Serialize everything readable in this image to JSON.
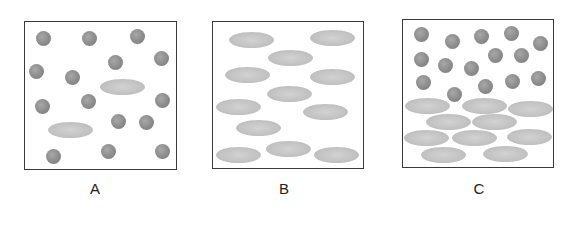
{
  "colors": {
    "border": "#3a3a3a",
    "sphere": "#8e8e8e",
    "ellipse": "#c2c2c2",
    "background": "#ffffff"
  },
  "panels": [
    {
      "label": "A",
      "box": {
        "left": 24,
        "top": 21,
        "right": 177,
        "bottom": 170
      },
      "label_pos": [
        95,
        188
      ],
      "spheres": [
        [
          43,
          38
        ],
        [
          89,
          38
        ],
        [
          137,
          36
        ],
        [
          115,
          62
        ],
        [
          161,
          58
        ],
        [
          36,
          71
        ],
        [
          72,
          77
        ],
        [
          42,
          106
        ],
        [
          88,
          101
        ],
        [
          162,
          100
        ],
        [
          118,
          121
        ],
        [
          146,
          122
        ],
        [
          53,
          156
        ],
        [
          108,
          151
        ],
        [
          162,
          151
        ]
      ],
      "ellipses": [
        [
          122,
          87
        ],
        [
          70,
          130
        ]
      ]
    },
    {
      "label": "B",
      "box": {
        "left": 212,
        "top": 21,
        "right": 364,
        "bottom": 169
      },
      "label_pos": [
        284,
        188
      ],
      "spheres": [],
      "ellipses": [
        [
          251,
          40
        ],
        [
          332,
          38
        ],
        [
          290,
          58
        ],
        [
          247,
          75
        ],
        [
          332,
          77
        ],
        [
          289,
          94
        ],
        [
          238,
          107
        ],
        [
          325,
          112
        ],
        [
          258,
          128
        ],
        [
          238,
          155
        ],
        [
          288,
          149
        ],
        [
          336,
          155
        ]
      ]
    },
    {
      "label": "C",
      "box": {
        "left": 402,
        "top": 19,
        "right": 554,
        "bottom": 168
      },
      "label_pos": [
        479,
        188
      ],
      "spheres": [
        [
          421,
          34
        ],
        [
          452,
          41
        ],
        [
          481,
          36
        ],
        [
          511,
          33
        ],
        [
          540,
          43
        ],
        [
          421,
          59
        ],
        [
          445,
          65
        ],
        [
          471,
          68
        ],
        [
          495,
          55
        ],
        [
          521,
          55
        ],
        [
          423,
          82
        ],
        [
          485,
          86
        ],
        [
          512,
          81
        ],
        [
          538,
          78
        ],
        [
          454,
          94
        ]
      ],
      "ellipses": [
        [
          427,
          106
        ],
        [
          484,
          106
        ],
        [
          530,
          109
        ],
        [
          448,
          122
        ],
        [
          494,
          122
        ],
        [
          426,
          138
        ],
        [
          474,
          138
        ],
        [
          529,
          137
        ],
        [
          443,
          155
        ],
        [
          505,
          154
        ]
      ]
    }
  ]
}
